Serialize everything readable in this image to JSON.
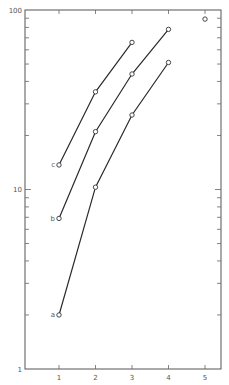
{
  "chart_data": {
    "type": "line",
    "title": "",
    "xlabel": "",
    "ylabel": "",
    "x_scale": "linear",
    "y_scale": "log",
    "xlim": [
      0,
      5.4
    ],
    "ylim": [
      1,
      100
    ],
    "x_ticks": [
      "1",
      "2",
      "3",
      "4",
      "5"
    ],
    "y_tick_labels": [
      "1",
      "10",
      "100"
    ],
    "grid": false,
    "legend": "inline labels at left end of each curve",
    "series": [
      {
        "name": "a",
        "x": [
          1,
          2,
          3,
          4
        ],
        "values": [
          2.0,
          10.3,
          26,
          51
        ]
      },
      {
        "name": "b",
        "x": [
          1,
          2,
          3,
          4
        ],
        "values": [
          6.9,
          21,
          44,
          78
        ]
      },
      {
        "name": "c",
        "x": [
          1,
          2,
          3
        ],
        "values": [
          13.7,
          35,
          66
        ]
      }
    ],
    "isolated_points": [
      {
        "x": 5,
        "value": 89
      }
    ]
  }
}
